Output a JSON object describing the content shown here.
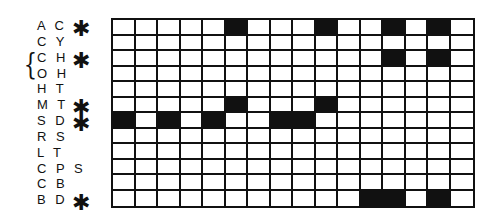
{
  "grid": {
    "columns": 16,
    "rows": [
      {
        "label": "A C",
        "marked": true,
        "filled": [
          6,
          10,
          13,
          15
        ]
      },
      {
        "label": "C Y",
        "marked": false,
        "filled": []
      },
      {
        "label": "C H",
        "marked": true,
        "filled": [
          13,
          15
        ]
      },
      {
        "label": "O H",
        "marked": false,
        "filled": []
      },
      {
        "label": "H T",
        "marked": false,
        "filled": []
      },
      {
        "label": "M T",
        "marked": true,
        "filled": [
          6,
          10
        ]
      },
      {
        "label": "S D",
        "marked": true,
        "filled": [
          1,
          3,
          5,
          8,
          9
        ]
      },
      {
        "label": "R S",
        "marked": false,
        "filled": []
      },
      {
        "label": "L T",
        "marked": false,
        "filled": []
      },
      {
        "label": "C P S",
        "marked": false,
        "filled": []
      },
      {
        "label": "C B",
        "marked": false,
        "filled": []
      },
      {
        "label": "B D",
        "marked": true,
        "filled": [
          12,
          13,
          15
        ]
      }
    ],
    "marker_symbol": "✱",
    "brace_symbol": "{",
    "brace_groups_rows": [
      "C H",
      "O H"
    ],
    "fill_color": "#111111",
    "empty_color": "#ffffff"
  }
}
